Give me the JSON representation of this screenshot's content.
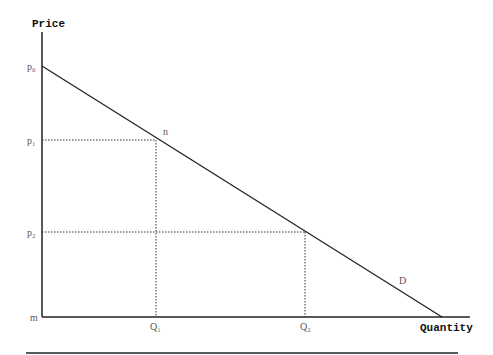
{
  "diagram": {
    "type": "demand-curve",
    "axes": {
      "y_label": "Price",
      "x_label": "Quantity",
      "origin_label": "m"
    },
    "price_labels": {
      "p0": "p₀",
      "p1": "p₁",
      "p2": "p₂"
    },
    "quantity_labels": {
      "q1": "Q₁",
      "q2": "Q₂"
    },
    "point_labels": {
      "n": "n",
      "curve": "D"
    },
    "colors": {
      "line": "#222222",
      "text": "#555555",
      "axis_label": "#111111"
    }
  }
}
